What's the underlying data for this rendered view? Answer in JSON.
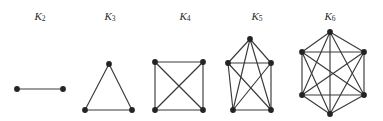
{
  "figure": {
    "background_color": "#ffffff",
    "edge_color": "#3a3a3a",
    "vertex_color": "#242424",
    "label_color": "#2b2b2b",
    "vertex_radius": 2.9,
    "edge_width": 1.15,
    "width": 383,
    "height": 121
  },
  "graphs": [
    {
      "name": "K2",
      "label_base": "K",
      "label_subscript": "2",
      "label_x": 40,
      "label_y": 17,
      "vertex_count": 2,
      "edge_count": 1,
      "vertices": [
        {
          "id": 0,
          "x": 17,
          "y": 89
        },
        {
          "id": 1,
          "x": 63,
          "y": 89
        }
      ],
      "edges": [
        [
          0,
          1
        ]
      ]
    },
    {
      "name": "K3",
      "label_base": "K",
      "label_subscript": "3",
      "label_x": 110,
      "label_y": 17,
      "vertex_count": 3,
      "edge_count": 3,
      "vertices": [
        {
          "id": 0,
          "x": 109,
          "y": 64
        },
        {
          "id": 1,
          "x": 85,
          "y": 110
        },
        {
          "id": 2,
          "x": 132,
          "y": 110
        }
      ],
      "edges": [
        [
          0,
          1
        ],
        [
          0,
          2
        ],
        [
          1,
          2
        ]
      ]
    },
    {
      "name": "K4",
      "label_base": "K",
      "label_subscript": "4",
      "label_x": 185,
      "label_y": 17,
      "vertex_count": 4,
      "edge_count": 6,
      "vertices": [
        {
          "id": 0,
          "x": 155,
          "y": 62
        },
        {
          "id": 1,
          "x": 203,
          "y": 62
        },
        {
          "id": 2,
          "x": 155,
          "y": 110
        },
        {
          "id": 3,
          "x": 203,
          "y": 110
        }
      ],
      "edges": [
        [
          0,
          1
        ],
        [
          0,
          2
        ],
        [
          0,
          3
        ],
        [
          1,
          2
        ],
        [
          1,
          3
        ],
        [
          2,
          3
        ]
      ]
    },
    {
      "name": "K5",
      "label_base": "K",
      "label_subscript": "5",
      "label_x": 257,
      "label_y": 17,
      "vertex_count": 5,
      "edge_count": 10,
      "vertices": [
        {
          "id": 0,
          "x": 250,
          "y": 39
        },
        {
          "id": 1,
          "x": 228,
          "y": 63
        },
        {
          "id": 2,
          "x": 271,
          "y": 63
        },
        {
          "id": 3,
          "x": 233,
          "y": 110
        },
        {
          "id": 4,
          "x": 271,
          "y": 110
        }
      ],
      "edges": [
        [
          0,
          1
        ],
        [
          0,
          2
        ],
        [
          0,
          3
        ],
        [
          0,
          4
        ],
        [
          1,
          2
        ],
        [
          1,
          3
        ],
        [
          1,
          4
        ],
        [
          2,
          3
        ],
        [
          2,
          4
        ],
        [
          3,
          4
        ]
      ]
    },
    {
      "name": "K6",
      "label_base": "K",
      "label_subscript": "6",
      "label_x": 330,
      "label_y": 17,
      "vertex_count": 6,
      "edge_count": 15,
      "vertices": [
        {
          "id": 0,
          "x": 330,
          "y": 32
        },
        {
          "id": 1,
          "x": 302,
          "y": 52
        },
        {
          "id": 2,
          "x": 364,
          "y": 52
        },
        {
          "id": 3,
          "x": 302,
          "y": 95
        },
        {
          "id": 4,
          "x": 364,
          "y": 95
        },
        {
          "id": 5,
          "x": 330,
          "y": 114
        }
      ],
      "edges": [
        [
          0,
          1
        ],
        [
          0,
          2
        ],
        [
          0,
          3
        ],
        [
          0,
          4
        ],
        [
          0,
          5
        ],
        [
          1,
          2
        ],
        [
          1,
          3
        ],
        [
          1,
          4
        ],
        [
          1,
          5
        ],
        [
          2,
          3
        ],
        [
          2,
          4
        ],
        [
          2,
          5
        ],
        [
          3,
          4
        ],
        [
          3,
          5
        ],
        [
          4,
          5
        ]
      ]
    }
  ]
}
